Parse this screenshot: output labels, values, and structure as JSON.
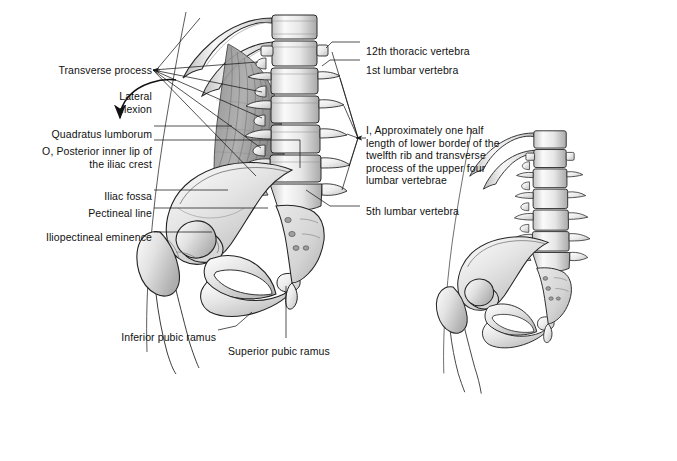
{
  "figure": {
    "ink_color": "#1a1a1a",
    "bone_fill": "#f2f2f2",
    "bone_shade": "#c9c9c9",
    "muscle_fill": "#9a9a9a",
    "background": "#ffffff"
  },
  "labels_left": [
    {
      "id": "transverse-process",
      "text": "Transverse process",
      "x": 48,
      "y": 64,
      "w": 104,
      "align": "right"
    },
    {
      "id": "lateral-flexion",
      "text": "Lateral\nflexion",
      "x": 92,
      "y": 90,
      "w": 60,
      "align": "right"
    },
    {
      "id": "quadratus-lumborum",
      "text": "Quadratus lumborum",
      "x": 38,
      "y": 128,
      "w": 114,
      "align": "right"
    },
    {
      "id": "posterior-inner-lip-iliac-crest",
      "text": "O, Posterior inner lip of\nthe iliac crest",
      "x": 28,
      "y": 145,
      "w": 124,
      "align": "right"
    },
    {
      "id": "iliac-fossa",
      "text": "Iliac fossa",
      "x": 92,
      "y": 190,
      "w": 60,
      "align": "right"
    },
    {
      "id": "pectineal-line",
      "text": "Pectineal line",
      "x": 73,
      "y": 207,
      "w": 79,
      "align": "right"
    },
    {
      "id": "iliopectineal-eminence",
      "text": "Iliopectineal eminence",
      "x": 29,
      "y": 231,
      "w": 123,
      "align": "right"
    },
    {
      "id": "inferior-pubic-ramus",
      "text": "Inferior pubic ramus",
      "x": 105,
      "y": 331,
      "w": 111,
      "align": "right"
    },
    {
      "id": "superior-pubic-ramus",
      "text": "Superior pubic ramus",
      "x": 228,
      "y": 345,
      "w": 118,
      "align": "left"
    }
  ],
  "labels_right": [
    {
      "id": "twelfth-thoracic-vertebra",
      "text": "12th thoracic vertebra",
      "x": 366,
      "y": 45,
      "w": 130,
      "align": "left"
    },
    {
      "id": "first-lumbar-vertebra",
      "text": "1st lumbar vertebra",
      "x": 366,
      "y": 64,
      "w": 130,
      "align": "left"
    },
    {
      "id": "insertion-note",
      "text": "I, Approximately one half\nlength of lower border of the\ntwelfth rib and transverse\nprocess of the upper four\nlumbar vertebrae",
      "x": 366,
      "y": 124,
      "w": 150,
      "align": "left"
    },
    {
      "id": "fifth-lumbar-vertebra",
      "text": "5th lumbar vertebra",
      "x": 366,
      "y": 205,
      "w": 130,
      "align": "left"
    }
  ],
  "leaders": {
    "transverse_process_fan_origin": {
      "x": 153,
      "y": 70
    },
    "insertion_fan_origin": {
      "x": 358,
      "y": 138
    },
    "lateral_flexion_arrow_tip": {
      "x": 121,
      "y": 123
    }
  }
}
